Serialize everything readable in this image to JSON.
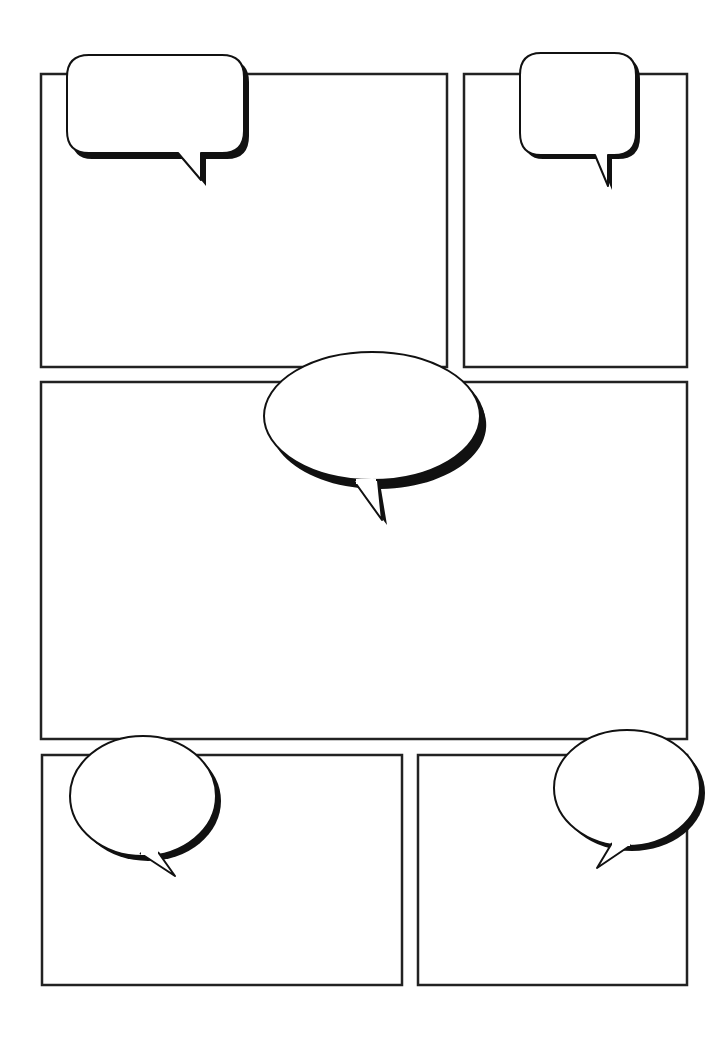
{
  "page": {
    "width": 716,
    "height": 1043,
    "background": "#ffffff",
    "line_color": "#222222"
  },
  "panels": [
    {
      "id": "panel-1",
      "x": 41,
      "y": 74,
      "w": 406,
      "h": 293
    },
    {
      "id": "panel-2",
      "x": 464,
      "y": 74,
      "w": 223,
      "h": 293
    },
    {
      "id": "panel-3",
      "x": 41,
      "y": 382,
      "w": 646,
      "h": 357
    },
    {
      "id": "panel-4",
      "x": 42,
      "y": 755,
      "w": 360,
      "h": 230
    },
    {
      "id": "panel-5",
      "x": 418,
      "y": 755,
      "w": 269,
      "h": 230
    }
  ],
  "bubbles": [
    {
      "id": "bubble-1",
      "shape": "rounded-rect",
      "text": ""
    },
    {
      "id": "bubble-2",
      "shape": "rounded-rect",
      "text": ""
    },
    {
      "id": "bubble-3",
      "shape": "oval",
      "text": ""
    },
    {
      "id": "bubble-4",
      "shape": "oval",
      "text": ""
    },
    {
      "id": "bubble-5",
      "shape": "oval",
      "text": ""
    }
  ]
}
